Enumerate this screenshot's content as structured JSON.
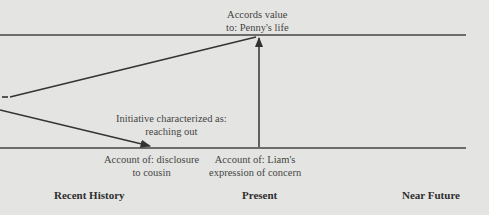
{
  "diagram": {
    "top_label": [
      "Accords value",
      "to: Penny's life"
    ],
    "middle_label": [
      "Initiative characterized as:",
      "reaching out"
    ],
    "bottom_left_label": [
      "Account of: disclosure",
      "to cousin"
    ],
    "bottom_right_label": [
      "Account of: Liam's",
      "expression of concern"
    ],
    "timeline": [
      "Recent History",
      "Present",
      "Near Future"
    ]
  },
  "colors": {
    "background": "#e4e4e2",
    "line": "#333333",
    "text": "#444444"
  }
}
